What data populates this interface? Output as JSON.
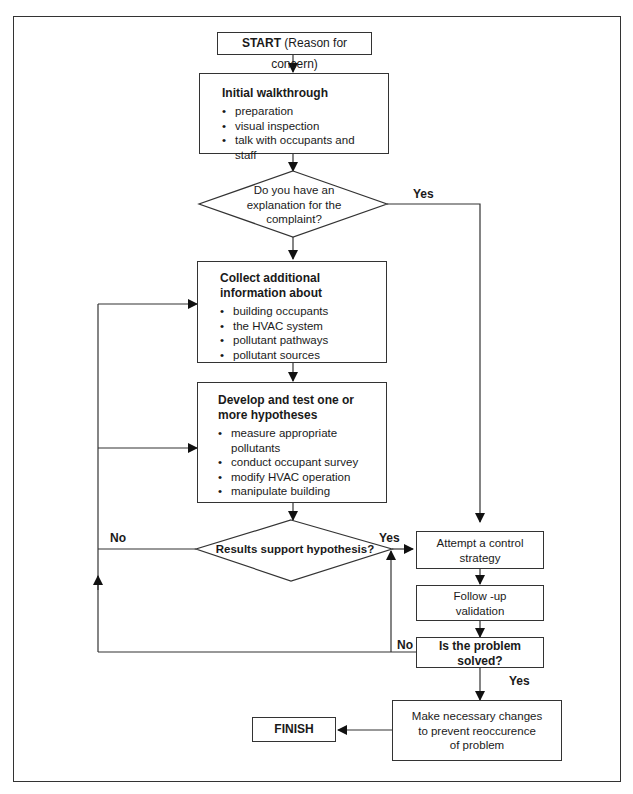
{
  "start": {
    "bold": "START",
    "rest": " (Reason for concern)"
  },
  "initial": {
    "title": "Initial walkthrough",
    "items": [
      "preparation",
      "visual inspection",
      "talk with occupants and staff"
    ]
  },
  "decision1": {
    "lines": [
      "Do you have an",
      "explanation for the",
      "complaint?"
    ],
    "yes_label": "Yes"
  },
  "collect": {
    "title_lines": [
      "Collect additional",
      "information about"
    ],
    "items": [
      "building occupants",
      "the HVAC system",
      "pollutant pathways",
      "pollutant sources"
    ]
  },
  "develop": {
    "title_lines": [
      "Develop and test one or",
      "more hypotheses"
    ],
    "items": [
      "measure appropriate pollutants",
      "conduct occupant survey",
      "modify HVAC operation",
      "manipulate building"
    ]
  },
  "decision2": {
    "text": "Results support hypothesis?",
    "yes_label": "Yes",
    "no_label": "No"
  },
  "attempt": {
    "lines": [
      "Attempt a control",
      "strategy"
    ]
  },
  "followup": {
    "lines": [
      "Follow -up",
      "validation"
    ]
  },
  "solved": {
    "lines": [
      "Is the problem",
      "solved?"
    ],
    "yes_label": "Yes",
    "no_label": "No"
  },
  "changes": {
    "lines": [
      "Make necessary changes",
      "to prevent reoccurence",
      "of problem"
    ]
  },
  "finish": {
    "label": "FINISH"
  },
  "colors": {
    "line": "#333333",
    "background": "#ffffff"
  }
}
